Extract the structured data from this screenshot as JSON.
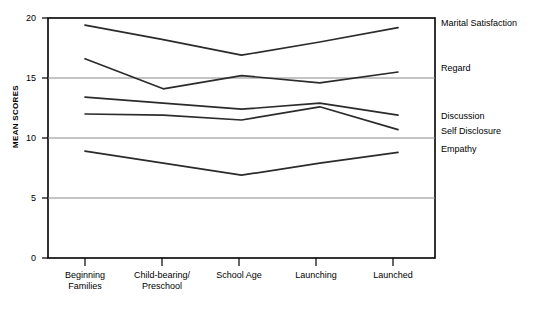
{
  "chart_data": {
    "type": "line",
    "title": "",
    "subtitle": "",
    "xlabel": "",
    "ylabel": "MEAN SCORES",
    "ylim": [
      0,
      20
    ],
    "yticks": [
      0,
      5,
      10,
      15,
      20
    ],
    "ytick_labels": [
      "0",
      "5",
      "10",
      "15",
      "20"
    ],
    "grid": true,
    "grid_values": [
      5,
      10,
      15
    ],
    "legend_position": "right-of-axes-inline",
    "categories": [
      "Beginning Families",
      "Child-bearing/ Preschool",
      "School Age",
      "Launching",
      "Launched"
    ],
    "category_lines": [
      [
        "Beginning",
        "Families"
      ],
      [
        "Child-bearing/",
        "Preschool"
      ],
      [
        "School Age",
        ""
      ],
      [
        "Launching",
        ""
      ],
      [
        "Launched",
        ""
      ]
    ],
    "series": [
      {
        "name": "Marital Satisfaction",
        "values": [
          19.4,
          18.2,
          16.9,
          18.0,
          19.2
        ]
      },
      {
        "name": "Regard",
        "values": [
          16.6,
          14.1,
          15.2,
          14.6,
          15.5
        ]
      },
      {
        "name": "Discussion",
        "values": [
          13.4,
          12.9,
          12.4,
          12.9,
          11.9
        ]
      },
      {
        "name": "Self Disclosure",
        "values": [
          12.0,
          11.9,
          11.5,
          12.6,
          10.7
        ]
      },
      {
        "name": "Empathy",
        "values": [
          8.9,
          7.9,
          6.9,
          7.9,
          8.8
        ]
      }
    ],
    "series_label_values": {
      "Marital Satisfaction": "Marital Satisfaction",
      "Regard": "Regard",
      "Discussion": "Discussion",
      "Self Disclosure": "Self Disclosure",
      "Empathy": "Empathy"
    },
    "colors": {
      "line": "#2b2b2b",
      "axis": "#000000",
      "grid": "#808080",
      "background": "#ffffff"
    }
  },
  "axes": {
    "y_title": "MEAN SCORES",
    "y_tick_0": "0",
    "y_tick_5": "5",
    "y_tick_10": "10",
    "y_tick_15": "15",
    "y_tick_20": "20",
    "x_tick_0_line1": "Beginning",
    "x_tick_0_line2": "Families",
    "x_tick_1_line1": "Child-bearing/",
    "x_tick_1_line2": "Preschool",
    "x_tick_2_line1": "School Age",
    "x_tick_3_line1": "Launching",
    "x_tick_4_line1": "Launched"
  },
  "series_labels": {
    "marital_satisfaction": "Marital Satisfaction",
    "regard": "Regard",
    "discussion": "Discussion",
    "self_disclosure": "Self Disclosure",
    "empathy": "Empathy"
  }
}
